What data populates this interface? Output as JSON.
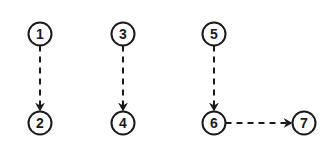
{
  "diagram": {
    "type": "directed-graph",
    "edge_style": "dashed-arrow",
    "colors": {
      "stroke": "#1a1a1a",
      "background": "#ffffff"
    },
    "nodes": [
      {
        "id": "1",
        "label": "1",
        "cx": 40,
        "cy": 34
      },
      {
        "id": "2",
        "label": "2",
        "cx": 40,
        "cy": 123
      },
      {
        "id": "3",
        "label": "3",
        "cx": 123,
        "cy": 34
      },
      {
        "id": "4",
        "label": "4",
        "cx": 123,
        "cy": 123
      },
      {
        "id": "5",
        "label": "5",
        "cx": 214,
        "cy": 34
      },
      {
        "id": "6",
        "label": "6",
        "cx": 214,
        "cy": 123
      },
      {
        "id": "7",
        "label": "7",
        "cx": 304,
        "cy": 123
      }
    ],
    "edges": [
      {
        "from": "1",
        "to": "2"
      },
      {
        "from": "3",
        "to": "4"
      },
      {
        "from": "5",
        "to": "6"
      },
      {
        "from": "6",
        "to": "7"
      }
    ]
  }
}
